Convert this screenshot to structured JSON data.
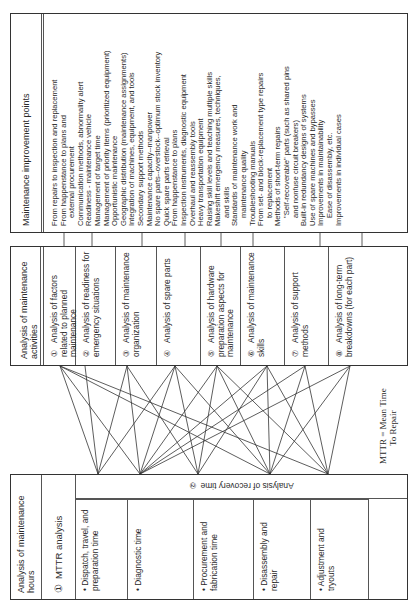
{
  "hours_box": {
    "title": "Analysis of maintenance hours",
    "mttr": {
      "num": "①",
      "label": "MTTR analysis"
    },
    "recovery": {
      "num": "②",
      "label": "Analysis of recovery time"
    },
    "items": [
      "• Dispatch, travel, and preparation time",
      "• Diagnostic time",
      "• Procurement and fabrication time",
      "• Disassembly and repair",
      "• Adjustment and tryouts"
    ]
  },
  "activities_box": {
    "title": "Analysis of maintenance activities",
    "items": [
      {
        "num": "①",
        "label": "Analysis of factors related to planned maintenance"
      },
      {
        "num": "②",
        "label": "Analysis of readiness for emergency situations"
      },
      {
        "num": "③",
        "label": "Analysis of maintenance organization"
      },
      {
        "num": "④",
        "label": "Analysis of spare parts"
      },
      {
        "num": "⑤",
        "label": "Analysis of hardware preparation aspects for maintenance"
      },
      {
        "num": "⑥",
        "label": "Analysis of maintenance skills"
      },
      {
        "num": "⑦",
        "label": "Analysis of support methods"
      },
      {
        "num": "⑧",
        "label": "Analysis of long-term breakdowns (for each part)"
      }
    ]
  },
  "improvement_box": {
    "title": "Maintenance improvement points",
    "items": [
      "From repairs to inspection and replacement",
      "From happenstance to plans and",
      "  external procurement",
      "Communication methods, abnormality alert",
      "Readiness - maintenance vehicle",
      "Management of target time",
      "Management of priority items (prioritized equipment)",
      "Opportunistic maintenance",
      "Geographic distribution (maintenance assignments)",
      "Integration of machines, equipment, and tools",
      "Secondary support methods",
      "Maintenance capacity--manpower",
      "No spare parts--overstock--optimum stock inventory",
      "Quick spare parts retrieval",
      "From happenstance to plans",
      "Inspection instruments, diagnostic equipment",
      "Overhaul and reassembly tools",
      "Heavy transportation equipment",
      "Raising skill levels and teaching multiple skills",
      "Makeshift emergency measures, techniques,",
      "  and skills",
      "Standards of maintenance work and",
      "  maintenance quality",
      "Troubleshooting manuals",
      "From set- and block-replacement type repairs",
      "  to replacement",
      "Methods of short-term repairs",
      "  \"Self-recoverable\" parts (such as shared pins",
      "  and nonfuse circuit breakers)",
      "Built-in redundancy designs of systems",
      "Use of spare machines and bypasses",
      "Improvements in maintainability",
      "    Ease of disassembly, etc.",
      "Improvements in individual cases"
    ]
  },
  "note": {
    "line1": "MTTR = Mean Time",
    "line2": "To Repair"
  },
  "colors": {
    "line": "#333333",
    "border": "#333333",
    "text": "#2a2a2a"
  }
}
